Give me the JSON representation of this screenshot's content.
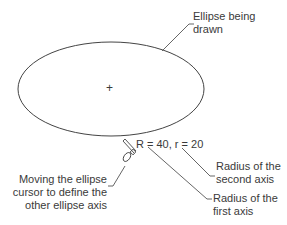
{
  "diagram": {
    "ellipse_label": [
      "Ellipse being",
      "drawn"
    ],
    "center_marker": "+",
    "radius_readout": "R = 40, r = 20",
    "second_axis_label": [
      "Radius of the",
      "second axis"
    ],
    "first_axis_label": [
      "Radius of the",
      "first axis"
    ],
    "cursor_label": [
      "Moving the ellipse",
      "cursor to define the",
      "other ellipse axis"
    ]
  },
  "colors": {
    "line": "#444444",
    "text": "#3a3a3a",
    "background": "#ffffff"
  }
}
